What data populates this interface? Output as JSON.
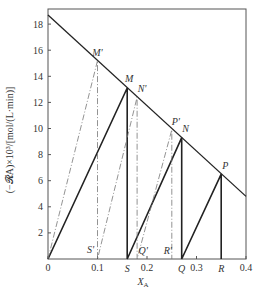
{
  "chart_data": {
    "type": "line",
    "title": "",
    "xlabel": "X_A",
    "ylabel": "(−𝓡A)×10³/[mol/(L·min)]",
    "xlim": [
      0,
      0.4
    ],
    "ylim": [
      0,
      19
    ],
    "x_ticks": [
      "0",
      "0.1",
      "0.2",
      "0.3",
      "0.4"
    ],
    "y_ticks": [
      "2",
      "4",
      "6",
      "8",
      "10",
      "12",
      "14",
      "16",
      "18"
    ],
    "grid": false,
    "rate_curve": {
      "name": "rate line",
      "x": [
        0,
        0.4
      ],
      "y": [
        18.7,
        4.8
      ]
    },
    "points": {
      "M_prime": {
        "label": "M'",
        "x": 0.1,
        "y": 15.2
      },
      "M": {
        "label": "M",
        "x": 0.16,
        "y": 13.1
      },
      "N_prime": {
        "label": "N'",
        "x": 0.18,
        "y": 12.4
      },
      "P_prime": {
        "label": "P'",
        "x": 0.25,
        "y": 9.9
      },
      "N": {
        "label": "N",
        "x": 0.27,
        "y": 9.3
      },
      "P": {
        "label": "P",
        "x": 0.35,
        "y": 6.5
      },
      "S_prime": {
        "label": "S'",
        "x": 0.1,
        "y": 0
      },
      "S": {
        "label": "S",
        "x": 0.16,
        "y": 0
      },
      "Q_prime": {
        "label": "Q'",
        "x": 0.18,
        "y": 0
      },
      "R_prime": {
        "label": "R'",
        "x": 0.25,
        "y": 0
      },
      "Q": {
        "label": "Q",
        "x": 0.27,
        "y": 0
      },
      "R": {
        "label": "R",
        "x": 0.35,
        "y": 0
      }
    },
    "series": [
      {
        "name": "solid staircase",
        "style": "solid",
        "path": [
          [
            0,
            0
          ],
          [
            0.16,
            13.1
          ],
          [
            0.16,
            0
          ],
          [
            0.27,
            9.3
          ],
          [
            0.27,
            0
          ],
          [
            0.35,
            6.5
          ],
          [
            0.35,
            0
          ]
        ]
      },
      {
        "name": "dash-dot staircase",
        "style": "dash-dot",
        "path": [
          [
            0,
            0
          ],
          [
            0.1,
            15.2
          ],
          [
            0.1,
            0
          ],
          [
            0.18,
            12.4
          ],
          [
            0.18,
            0
          ],
          [
            0.25,
            9.9
          ],
          [
            0.25,
            0
          ]
        ]
      }
    ]
  }
}
